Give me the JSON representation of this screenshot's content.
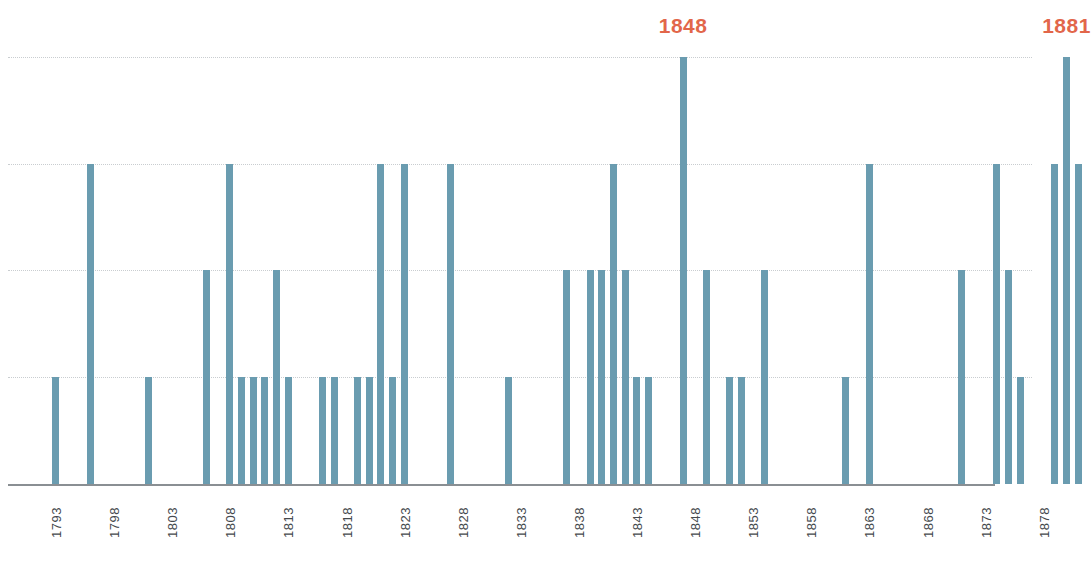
{
  "chart_data": {
    "type": "bar",
    "title": "",
    "subtitle": "",
    "xlabel": "年分",
    "ylabel": "",
    "grid": true,
    "legend": null,
    "xlim": [
      1793,
      1895
    ],
    "ylim": [
      0,
      4
    ],
    "y_gridline_values": [
      1,
      2,
      3,
      4
    ],
    "x_tick_labels": [
      "1793",
      "1798",
      "1803",
      "1808",
      "1813",
      "1818",
      "1823",
      "1828",
      "1833",
      "1838",
      "1843",
      "1848",
      "1853",
      "1858",
      "1863",
      "1868",
      "1873",
      "1878",
      "1883",
      "1888",
      "1893",
      "1895"
    ],
    "x_tick_values": [
      1793,
      1798,
      1803,
      1808,
      1813,
      1818,
      1823,
      1828,
      1833,
      1838,
      1843,
      1848,
      1853,
      1858,
      1863,
      1868,
      1873,
      1878,
      1883,
      1888,
      1893,
      1895
    ],
    "bar_color": "#6a9cb0",
    "annotation_color": "#e2664a",
    "axis_color": "#8a8f93",
    "grid_color": "#c9cdd0",
    "annotations": [
      {
        "label": "1848",
        "year": 1848,
        "value": 4
      },
      {
        "label": "1881",
        "year": 1881,
        "value": 4
      }
    ],
    "points": [
      {
        "x": 1794,
        "y": 1
      },
      {
        "x": 1797,
        "y": 3
      },
      {
        "x": 1802,
        "y": 1
      },
      {
        "x": 1807,
        "y": 2
      },
      {
        "x": 1809,
        "y": 3
      },
      {
        "x": 1810,
        "y": 1
      },
      {
        "x": 1811,
        "y": 1
      },
      {
        "x": 1812,
        "y": 1
      },
      {
        "x": 1813,
        "y": 2
      },
      {
        "x": 1814,
        "y": 1
      },
      {
        "x": 1817,
        "y": 1
      },
      {
        "x": 1818,
        "y": 1
      },
      {
        "x": 1820,
        "y": 1
      },
      {
        "x": 1821,
        "y": 1
      },
      {
        "x": 1822,
        "y": 3
      },
      {
        "x": 1823,
        "y": 1
      },
      {
        "x": 1824,
        "y": 3
      },
      {
        "x": 1828,
        "y": 3
      },
      {
        "x": 1833,
        "y": 1
      },
      {
        "x": 1838,
        "y": 2
      },
      {
        "x": 1840,
        "y": 2
      },
      {
        "x": 1841,
        "y": 2
      },
      {
        "x": 1842,
        "y": 3
      },
      {
        "x": 1843,
        "y": 2
      },
      {
        "x": 1844,
        "y": 1
      },
      {
        "x": 1845,
        "y": 1
      },
      {
        "x": 1848,
        "y": 4
      },
      {
        "x": 1850,
        "y": 2
      },
      {
        "x": 1852,
        "y": 1
      },
      {
        "x": 1853,
        "y": 1
      },
      {
        "x": 1855,
        "y": 2
      },
      {
        "x": 1862,
        "y": 1
      },
      {
        "x": 1864,
        "y": 3
      },
      {
        "x": 1872,
        "y": 2
      },
      {
        "x": 1875,
        "y": 3
      },
      {
        "x": 1876,
        "y": 2
      },
      {
        "x": 1877,
        "y": 1
      },
      {
        "x": 1880,
        "y": 3
      },
      {
        "x": 1881,
        "y": 4
      },
      {
        "x": 1882,
        "y": 3
      },
      {
        "x": 1884,
        "y": 2
      },
      {
        "x": 1890,
        "y": 3
      },
      {
        "x": 1892,
        "y": 2
      }
    ]
  }
}
